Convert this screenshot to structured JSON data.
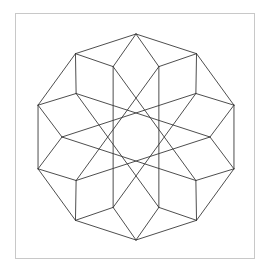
{
  "figure": {
    "type": "decagonal rhombic star pattern",
    "center": [
      136,
      137
    ],
    "outer_radius": 103,
    "inner_radius": 74,
    "symmetry": 10,
    "outer_start_angle_deg": 90,
    "inner_start_angle_deg": 108,
    "chord_step": 4,
    "stroke_color": "#3a3a3a",
    "stroke_width": 0.9,
    "frame_color": "#c8c8c8",
    "background": "#ffffff"
  }
}
